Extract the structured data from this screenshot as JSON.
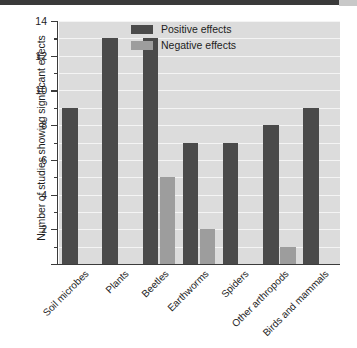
{
  "chart_data": {
    "type": "bar",
    "title": "",
    "xlabel": "",
    "ylabel": "Number of studies showing significant effects",
    "ylim": [
      0,
      14
    ],
    "ytick_step": 2,
    "yticks": [
      0,
      2,
      4,
      6,
      8,
      10,
      12,
      14
    ],
    "ytick_labels": [
      "",
      "2",
      "4",
      "6",
      "8",
      "10",
      "12",
      "14"
    ],
    "minor_ticks": [
      1,
      3,
      5,
      7,
      9,
      11,
      13
    ],
    "grid": "horizontal-white-gridlines",
    "legend_position": "upper-center",
    "categories": [
      "Soil microbes",
      "Plants",
      "Beetles",
      "Earthworms",
      "Spiders",
      "Other arthropods",
      "Birds and mammals"
    ],
    "series": [
      {
        "name": "Positive effects",
        "color": "#4a4a4a",
        "values": [
          9,
          13,
          13,
          7,
          7,
          8,
          9
        ]
      },
      {
        "name": "Negative effects",
        "color": "#9d9d9d",
        "values": [
          0,
          0,
          5,
          2,
          0,
          1,
          0
        ]
      }
    ]
  },
  "legend": {
    "items": [
      {
        "label": "Positive effects",
        "color": "#4a4a4a"
      },
      {
        "label": "Negative effects",
        "color": "#9d9d9d"
      }
    ]
  },
  "axes": {
    "y_title": "Number of studies showing significant effects"
  },
  "colors": {
    "positive": "#4a4a4a",
    "negative": "#9d9d9d",
    "plot_background": "#dcdcdc",
    "gridline": "#f4f4f4",
    "axis": "#3b3b3b",
    "text": "#1d1d1d"
  }
}
